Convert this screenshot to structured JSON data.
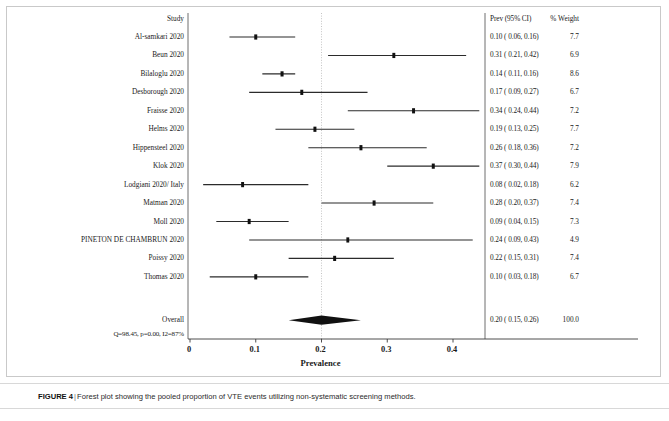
{
  "figure": {
    "caption_label": "FIGURE 4",
    "caption_separator": "|",
    "caption_text": "Forest plot showing the pooled proportion of VTE events utilizing non-systematic screening methods."
  },
  "columns": {
    "study_header": "Study",
    "estimate_header": "Prev (95% CI)",
    "weight_header": "% Weight"
  },
  "heterogeneity": "Q=98.45, p=0.00, I2=87%",
  "overall_label": "Overall",
  "chart_data": {
    "type": "forest",
    "title": "Forest plot showing the pooled proportion of VTE events utilizing non-systematic screening methods.",
    "xlabel": "Prevalence",
    "ylabel": "",
    "xlim": [
      0.0,
      0.45
    ],
    "xticks": [
      0,
      0.1,
      0.2,
      0.3,
      0.4
    ],
    "xtick_labels": [
      "0",
      "0.1",
      "0.2",
      "0.3",
      "0.4"
    ],
    "grid": false,
    "reference_line": 0.2,
    "effect_measure": "Prevalence",
    "heterogeneity": {
      "Q": 98.45,
      "p": 0.0,
      "I2": 87
    },
    "studies": [
      {
        "label": "Al-samkari 2020",
        "est": 0.1,
        "lo": 0.06,
        "hi": 0.16,
        "weight": 7.7,
        "ci_text": "0.10 (  0.06,  0.16)",
        "weight_text": "7.7"
      },
      {
        "label": "Beun 2020",
        "est": 0.31,
        "lo": 0.21,
        "hi": 0.42,
        "weight": 6.9,
        "ci_text": "0.31 (  0.21,  0.42)",
        "weight_text": "6.9"
      },
      {
        "label": "Bilaloglu 2020",
        "est": 0.14,
        "lo": 0.11,
        "hi": 0.16,
        "weight": 8.6,
        "ci_text": "0.14 (  0.11,  0.16)",
        "weight_text": "8.6"
      },
      {
        "label": "Desborough 2020",
        "est": 0.17,
        "lo": 0.09,
        "hi": 0.27,
        "weight": 6.7,
        "ci_text": "0.17 (  0.09,  0.27)",
        "weight_text": "6.7"
      },
      {
        "label": "Fraisse 2020",
        "est": 0.34,
        "lo": 0.24,
        "hi": 0.44,
        "weight": 7.2,
        "ci_text": "0.34 (  0.24,  0.44)",
        "weight_text": "7.2"
      },
      {
        "label": "Helms 2020",
        "est": 0.19,
        "lo": 0.13,
        "hi": 0.25,
        "weight": 7.7,
        "ci_text": "0.19 (  0.13,  0.25)",
        "weight_text": "7.7"
      },
      {
        "label": "Hippensteel 2020",
        "est": 0.26,
        "lo": 0.18,
        "hi": 0.36,
        "weight": 7.2,
        "ci_text": "0.26 (  0.18,  0.36)",
        "weight_text": "7.2"
      },
      {
        "label": "Klok 2020",
        "est": 0.37,
        "lo": 0.3,
        "hi": 0.44,
        "weight": 7.9,
        "ci_text": "0.37 (  0.30,  0.44)",
        "weight_text": "7.9"
      },
      {
        "label": "Lodgiani 2020/ Italy",
        "est": 0.08,
        "lo": 0.02,
        "hi": 0.18,
        "weight": 6.2,
        "ci_text": "0.08 (  0.02,  0.18)",
        "weight_text": "6.2"
      },
      {
        "label": "Matman 2020",
        "est": 0.28,
        "lo": 0.2,
        "hi": 0.37,
        "weight": 7.4,
        "ci_text": "0.28 (  0.20,  0.37)",
        "weight_text": "7.4"
      },
      {
        "label": "Moll 2020",
        "est": 0.09,
        "lo": 0.04,
        "hi": 0.15,
        "weight": 7.3,
        "ci_text": "0.09 (  0.04,  0.15)",
        "weight_text": "7.3"
      },
      {
        "label": "PINETON DE CHAMBRUN 2020",
        "est": 0.24,
        "lo": 0.09,
        "hi": 0.43,
        "weight": 4.9,
        "ci_text": "0.24 (  0.09,  0.43)",
        "weight_text": "4.9"
      },
      {
        "label": "Poissy 2020",
        "est": 0.22,
        "lo": 0.15,
        "hi": 0.31,
        "weight": 7.4,
        "ci_text": "0.22 (  0.15,  0.31)",
        "weight_text": "7.4"
      },
      {
        "label": "Thomas 2020",
        "est": 0.1,
        "lo": 0.03,
        "hi": 0.18,
        "weight": 6.7,
        "ci_text": "0.10 (  0.03,  0.18)",
        "weight_text": "6.7"
      }
    ],
    "overall": {
      "label": "Overall",
      "est": 0.2,
      "lo": 0.15,
      "hi": 0.26,
      "weight": 100.0,
      "ci_text": "0.20 (  0.15,  0.26)",
      "weight_text": "100.0"
    }
  }
}
